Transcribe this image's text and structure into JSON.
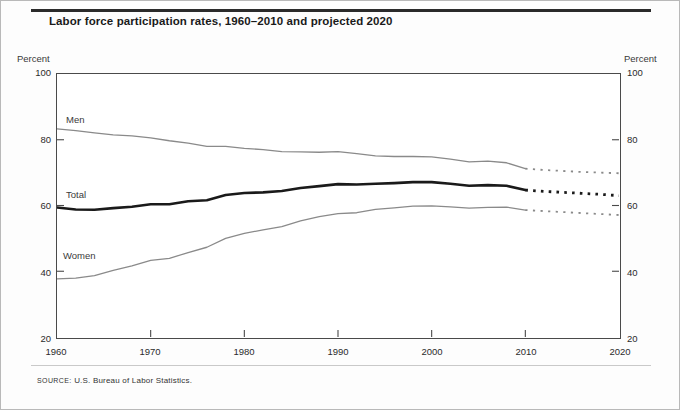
{
  "figure": {
    "title": "Labor force participation rates, 1960–2010 and projected 2020",
    "source_label": "SOURCE:",
    "source_text": "U.S. Bureau of Labor Statistics.",
    "left_axis_caption": "Percent",
    "right_axis_caption": "Percent"
  },
  "chart_data": {
    "type": "line",
    "title": "Labor force participation rates, 1960–2010 and projected 2020",
    "xlabel": "",
    "ylabel": "Percent",
    "xlim": [
      1960,
      2020
    ],
    "ylim": [
      20,
      100
    ],
    "xticks": [
      1960,
      1970,
      1980,
      1990,
      2000,
      2010,
      2020
    ],
    "yticks": [
      20,
      40,
      60,
      80,
      100
    ],
    "grid": false,
    "legend": "inline-labels",
    "projection_note": "Dotted segments from 2010 to 2020 are projections",
    "colors": {
      "men": "#8a8a8a",
      "total": "#1a1a1a",
      "women": "#8a8a8a",
      "axis": "#4a4a4a"
    },
    "series": [
      {
        "name": "Men",
        "style": "solid",
        "x": [
          1960,
          1962,
          1964,
          1966,
          1968,
          1970,
          1972,
          1974,
          1976,
          1978,
          1980,
          1982,
          1984,
          1986,
          1988,
          1990,
          1992,
          1994,
          1996,
          1998,
          2000,
          2002,
          2004,
          2006,
          2008,
          2010
        ],
        "values": [
          83.3,
          82.8,
          82.1,
          81.5,
          81.2,
          80.6,
          79.7,
          79.0,
          78.0,
          78.0,
          77.4,
          77.0,
          76.4,
          76.3,
          76.2,
          76.4,
          75.8,
          75.1,
          74.9,
          74.9,
          74.8,
          74.1,
          73.3,
          73.5,
          73.0,
          71.2
        ],
        "projected_x": [
          2010,
          2012,
          2014,
          2016,
          2018,
          2020
        ],
        "projected_values": [
          71.2,
          70.8,
          70.5,
          70.2,
          70.0,
          69.8
        ]
      },
      {
        "name": "Total",
        "style": "solid-bold",
        "x": [
          1960,
          1962,
          1964,
          1966,
          1968,
          1970,
          1972,
          1974,
          1976,
          1978,
          1980,
          1982,
          1984,
          1986,
          1988,
          1990,
          1992,
          1994,
          1996,
          1998,
          2000,
          2002,
          2004,
          2006,
          2008,
          2010
        ],
        "values": [
          59.4,
          58.8,
          58.7,
          59.2,
          59.6,
          60.4,
          60.4,
          61.3,
          61.6,
          63.2,
          63.8,
          64.0,
          64.4,
          65.3,
          65.9,
          66.5,
          66.4,
          66.6,
          66.8,
          67.1,
          67.1,
          66.6,
          66.0,
          66.2,
          66.0,
          64.7
        ],
        "projected_x": [
          2010,
          2012,
          2014,
          2016,
          2018,
          2020
        ],
        "projected_values": [
          64.7,
          64.3,
          64.0,
          63.7,
          63.4,
          63.0
        ]
      },
      {
        "name": "Women",
        "style": "solid",
        "x": [
          1960,
          1962,
          1964,
          1966,
          1968,
          1970,
          1972,
          1974,
          1976,
          1978,
          1980,
          1982,
          1984,
          1986,
          1988,
          1990,
          1992,
          1994,
          1996,
          1998,
          2000,
          2002,
          2004,
          2006,
          2008,
          2010
        ],
        "values": [
          37.7,
          37.9,
          38.7,
          40.3,
          41.6,
          43.3,
          43.9,
          45.7,
          47.3,
          50.0,
          51.5,
          52.6,
          53.6,
          55.3,
          56.6,
          57.5,
          57.8,
          58.8,
          59.3,
          59.8,
          59.9,
          59.6,
          59.2,
          59.4,
          59.5,
          58.6
        ],
        "projected_x": [
          2010,
          2012,
          2014,
          2016,
          2018,
          2020
        ],
        "projected_values": [
          58.6,
          58.3,
          58.0,
          57.7,
          57.4,
          57.1
        ]
      }
    ]
  },
  "axes": {
    "y_left": [
      "100",
      "80",
      "60",
      "40",
      "20"
    ],
    "y_right": [
      "100",
      "80",
      "60",
      "40",
      "20"
    ],
    "x": [
      "1960",
      "1970",
      "1980",
      "1990",
      "2000",
      "2010",
      "2020"
    ]
  },
  "series_labels": {
    "men": "Men",
    "total": "Total",
    "women": "Women"
  }
}
